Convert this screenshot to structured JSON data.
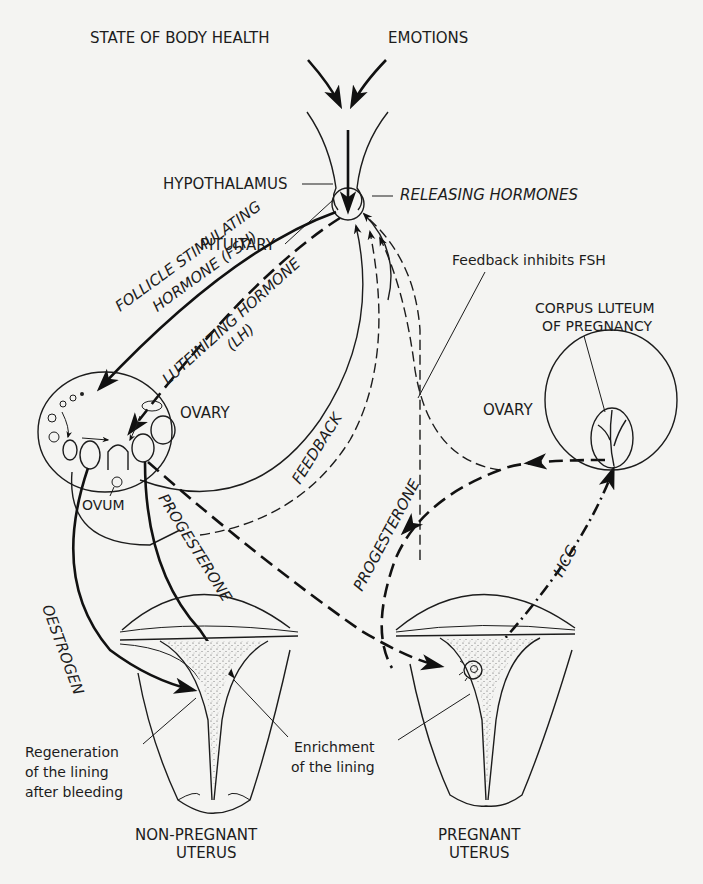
{
  "diagram": {
    "top_inputs": {
      "body_health": "STATE OF BODY HEALTH",
      "emotions": "EMOTIONS"
    },
    "brain": {
      "hypothalamus": "HYPOTHALAMUS",
      "releasing_hormones": "RELEASING HORMONES",
      "pituitary": "PITUITARY"
    },
    "hormones": {
      "fsh_line1": "FOLLICLE STIMULATING",
      "fsh_line2": "HORMONE (FSH)",
      "lh_line1": "LUTEINIZING HORMONE",
      "lh_line2": "(LH)",
      "feedback": "FEEDBACK",
      "feedback_inhibits": "Feedback inhibits FSH",
      "progesterone_left": "PROGESTERONE",
      "progesterone_right": "PROGESTERONE",
      "oestrogen": "OESTROGEN",
      "hcg": "HCG"
    },
    "left_ovary": {
      "label": "OVARY",
      "ovum": "OVUM"
    },
    "right_ovary": {
      "label": "OVARY",
      "corpus_line1": "CORPUS LUTEUM",
      "corpus_line2": "OF PREGNANCY"
    },
    "annotations": {
      "regeneration_line1": "Regeneration",
      "regeneration_line2": "of the lining",
      "regeneration_line3": "after bleeding",
      "enrichment_line1": "Enrichment",
      "enrichment_line2": "of the lining"
    },
    "uteri": {
      "non_pregnant_line1": "NON-PREGNANT",
      "non_pregnant_line2": "UTERUS",
      "pregnant_line1": "PREGNANT",
      "pregnant_line2": "UTERUS"
    }
  }
}
